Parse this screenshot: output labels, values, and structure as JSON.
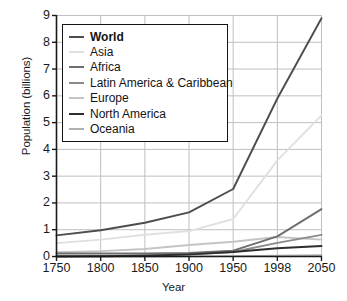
{
  "chart_data": {
    "type": "line",
    "title": "",
    "xlabel": "Year",
    "ylabel": "Population (billions)",
    "x": [
      "1750",
      "1800",
      "1850",
      "1900",
      "1950",
      "1998",
      "2050"
    ],
    "categories": [
      "1750",
      "1800",
      "1850",
      "1900",
      "1950",
      "1998",
      "2050"
    ],
    "xtick_labels": [
      "1750",
      "1800",
      "1850",
      "1900",
      "1950",
      "1998",
      "2050"
    ],
    "ytick_labels": [
      "0",
      "1",
      "2",
      "3",
      "4",
      "5",
      "6",
      "7",
      "8",
      "9"
    ],
    "ylim": [
      0,
      9
    ],
    "ylim_min": 0,
    "ylim_max": 9,
    "grid": true,
    "legend_position": "upper-left",
    "series": [
      {
        "name": "World",
        "color": "#4d4d4d",
        "width": 1.9,
        "bold_label": true,
        "values": [
          0.79,
          0.98,
          1.26,
          1.65,
          2.52,
          5.9,
          8.9
        ]
      },
      {
        "name": "Asia",
        "color": "#e0e0e0",
        "width": 1.9,
        "bold_label": false,
        "values": [
          0.5,
          0.63,
          0.81,
          0.95,
          1.4,
          3.59,
          5.27
        ]
      },
      {
        "name": "Africa",
        "color": "#6e6e6e",
        "width": 1.9,
        "bold_label": false,
        "values": [
          0.11,
          0.11,
          0.11,
          0.13,
          0.22,
          0.75,
          1.77
        ]
      },
      {
        "name": "Latin America & Caribbean",
        "color": "#8a8a8a",
        "width": 1.9,
        "bold_label": false,
        "values": [
          0.02,
          0.02,
          0.04,
          0.07,
          0.17,
          0.51,
          0.81
        ]
      },
      {
        "name": "Europe",
        "color": "#c4c4c4",
        "width": 1.9,
        "bold_label": false,
        "values": [
          0.16,
          0.2,
          0.28,
          0.43,
          0.55,
          0.73,
          0.63
        ]
      },
      {
        "name": "North America",
        "color": "#2e2e2e",
        "width": 1.9,
        "bold_label": false,
        "values": [
          0.002,
          0.01,
          0.03,
          0.08,
          0.17,
          0.31,
          0.39
        ]
      },
      {
        "name": "Oceania",
        "color": "#b0b0b0",
        "width": 1.9,
        "bold_label": false,
        "values": [
          0.002,
          0.002,
          0.002,
          0.006,
          0.013,
          0.03,
          0.05
        ]
      }
    ]
  },
  "legend": {
    "items": [
      {
        "label": "World"
      },
      {
        "label": "Asia"
      },
      {
        "label": "Africa"
      },
      {
        "label": "Latin America & Caribbean"
      },
      {
        "label": "Europe"
      },
      {
        "label": "North America"
      },
      {
        "label": "Oceania"
      }
    ]
  },
  "colors": {
    "axis": "#1a1a1a",
    "grid": "#bfbfbf",
    "background": "#ffffff",
    "legend_border": "#141414"
  }
}
